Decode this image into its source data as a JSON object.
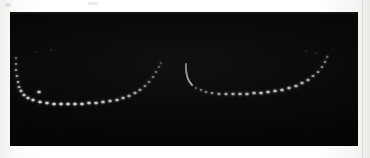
{
  "figure": {
    "title": "Dotted double-arc fringe pattern",
    "medium": "scanned photographic print",
    "background_color": "#050505",
    "paper_color": "#fbfbfa",
    "mark_color": "#ffffff",
    "panel": {
      "x": 10,
      "y": 12,
      "width": 348,
      "height": 134
    }
  },
  "chart_data": {
    "type": "scatter",
    "title": "Dotted double-arc fringe pattern",
    "subtitle": "",
    "xlabel": "",
    "ylabel": "",
    "grid": false,
    "legend_position": "none",
    "xlim": [
      0,
      348
    ],
    "ylim": [
      134,
      0
    ],
    "background": "#050505",
    "series": [
      {
        "name": "left-arc",
        "style": "dotted",
        "color": "#ffffff",
        "points": [
          [
            6,
            46
          ],
          [
            6,
            52
          ],
          [
            6,
            58
          ],
          [
            7,
            64
          ],
          [
            8,
            70
          ],
          [
            9,
            75
          ],
          [
            11,
            79
          ],
          [
            14,
            83
          ],
          [
            18,
            86
          ],
          [
            23,
            88
          ],
          [
            29,
            80
          ],
          [
            30,
            90
          ],
          [
            37,
            91
          ],
          [
            44,
            92
          ],
          [
            51,
            92
          ],
          [
            58,
            92
          ],
          [
            65,
            92
          ],
          [
            72,
            92
          ],
          [
            79,
            91
          ],
          [
            86,
            91
          ],
          [
            93,
            90
          ],
          [
            100,
            89
          ],
          [
            107,
            88
          ],
          [
            113,
            86
          ],
          [
            119,
            84
          ],
          [
            125,
            81
          ],
          [
            130,
            78
          ],
          [
            135,
            74
          ],
          [
            139,
            70
          ],
          [
            143,
            65
          ],
          [
            146,
            60
          ],
          [
            149,
            55
          ],
          [
            151,
            51
          ]
        ]
      },
      {
        "name": "right-arc-solid-head",
        "style": "solid",
        "color": "#ffffff",
        "points": [
          [
            176,
            52
          ],
          [
            176,
            58
          ],
          [
            177,
            64
          ],
          [
            179,
            69
          ],
          [
            182,
            73
          ]
        ]
      },
      {
        "name": "right-arc",
        "style": "dotted",
        "color": "#ffffff",
        "points": [
          [
            186,
            76
          ],
          [
            191,
            78
          ],
          [
            196,
            80
          ],
          [
            202,
            81
          ],
          [
            209,
            82
          ],
          [
            216,
            82
          ],
          [
            223,
            82
          ],
          [
            230,
            82
          ],
          [
            237,
            82
          ],
          [
            244,
            81
          ],
          [
            251,
            81
          ],
          [
            258,
            80
          ],
          [
            265,
            79
          ],
          [
            272,
            78
          ],
          [
            279,
            76
          ],
          [
            286,
            74
          ],
          [
            292,
            71
          ],
          [
            298,
            68
          ],
          [
            303,
            64
          ],
          [
            308,
            60
          ],
          [
            312,
            55
          ],
          [
            315,
            50
          ],
          [
            317,
            45
          ]
        ]
      },
      {
        "name": "faint-upper-specks",
        "style": "dotted-faint",
        "color": "#9a9a9a",
        "points": [
          [
            26,
            40
          ],
          [
            41,
            38
          ],
          [
            296,
            39
          ],
          [
            306,
            41
          ],
          [
            318,
            44
          ]
        ]
      }
    ],
    "annotations": []
  }
}
